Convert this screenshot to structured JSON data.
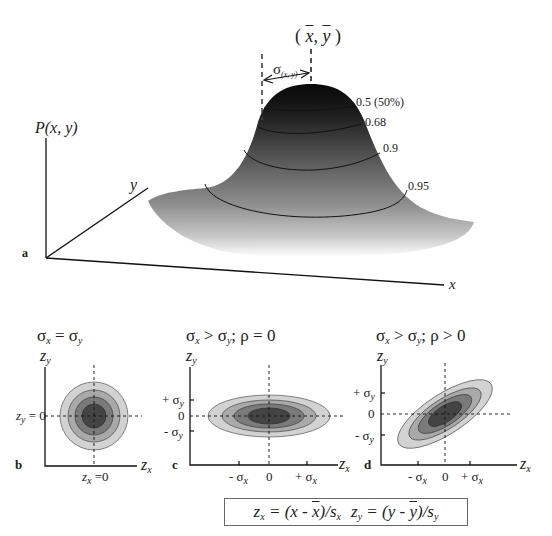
{
  "panel_a": {
    "panel_label": "a",
    "axis_p_label": "P(x, y)",
    "axis_x_label": "x",
    "axis_y_label": "y",
    "mean_label": "( x, y )",
    "mean_x": "x",
    "mean_y": "y",
    "sigma_label": "σ",
    "sigma_sub": "(x, y)",
    "contours": [
      {
        "label": "0.5  (50%)"
      },
      {
        "label": "0.68"
      },
      {
        "label": "0.9"
      },
      {
        "label": "0.95"
      }
    ]
  },
  "panel_b": {
    "panel_label": "b",
    "title": "σx = σy",
    "title_parts": {
      "s1": "σ",
      "sub1": "x",
      "eq": " = ",
      "s2": "σ",
      "sub2": "y"
    },
    "z_y_axis": "z",
    "z_y_sub": "y",
    "z_x_axis": "z",
    "z_x_sub": "x",
    "y_zero_label": "zy = 0",
    "y_zero_parts": {
      "z": "z",
      "sub": "y",
      "rest": " = 0"
    },
    "x_zero_parts": {
      "z": "z",
      "sub": "x",
      "rest": " =0"
    }
  },
  "panel_c": {
    "panel_label": "c",
    "title": "σx > σy;  ρ = 0",
    "title_parts": {
      "s1": "σ",
      "sub1": "x",
      "op": " > ",
      "s2": "σ",
      "sub2": "y",
      "rest": ";  ρ = 0"
    },
    "y_ticks": [
      {
        "pre": "+ σ",
        "sub": "y"
      },
      {
        "pre": "0",
        "sub": ""
      },
      {
        "pre": "- σ",
        "sub": "y"
      }
    ],
    "x_ticks": [
      {
        "pre": "- σ",
        "sub": "x"
      },
      {
        "pre": "0",
        "sub": ""
      },
      {
        "pre": "+ σ",
        "sub": "x"
      }
    ],
    "z_y_axis": "z",
    "z_y_sub": "y",
    "z_x_axis": "z",
    "z_x_sub": "x"
  },
  "panel_d": {
    "panel_label": "d",
    "title": "σx > σy;  ρ > 0",
    "title_parts": {
      "s1": "σ",
      "sub1": "x",
      "op": " > ",
      "s2": "σ",
      "sub2": "y",
      "rest": ";  ρ > 0"
    },
    "y_ticks": [
      {
        "pre": "+ σ",
        "sub": "y"
      },
      {
        "pre": "0",
        "sub": ""
      },
      {
        "pre": "- σ",
        "sub": "y"
      }
    ],
    "x_ticks": [
      {
        "pre": "- σ",
        "sub": "x"
      },
      {
        "pre": "0",
        "sub": ""
      },
      {
        "pre": "+ σ",
        "sub": "x"
      }
    ],
    "z_y_axis": "z",
    "z_y_sub": "y",
    "z_x_axis": "z",
    "z_x_sub": "x"
  },
  "formula": {
    "text": "zx = (x - x̄)/sx  zy = (y - ȳ)/sy",
    "zx": "z",
    "zx_sub": "x",
    "zx_eq": " = (x - ",
    "xbar": "x",
    "zx_tail": ")/s",
    "sx_sub": "x",
    "zy": "z",
    "zy_sub": "y",
    "zy_eq": " = (y - ",
    "ybar": "y",
    "zy_tail": ")/s",
    "sy_sub": "y"
  },
  "colors": {
    "fill_outer": "#d2d2d2",
    "fill_2": "#a9a9a9",
    "fill_3": "#7a7a7a",
    "fill_inner": "#444444",
    "peak": "#0c0c0c",
    "line": "#222222"
  }
}
